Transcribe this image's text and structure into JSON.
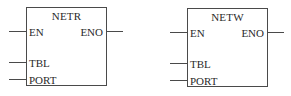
{
  "blocks": [
    {
      "name": "NETR",
      "inputs": [
        "EN",
        "TBL",
        "PORT"
      ],
      "outputs": [
        "ENO"
      ]
    },
    {
      "name": "NETW",
      "inputs": [
        "EN",
        "TBL",
        "PORT"
      ],
      "outputs": [
        "ENO"
      ]
    }
  ]
}
